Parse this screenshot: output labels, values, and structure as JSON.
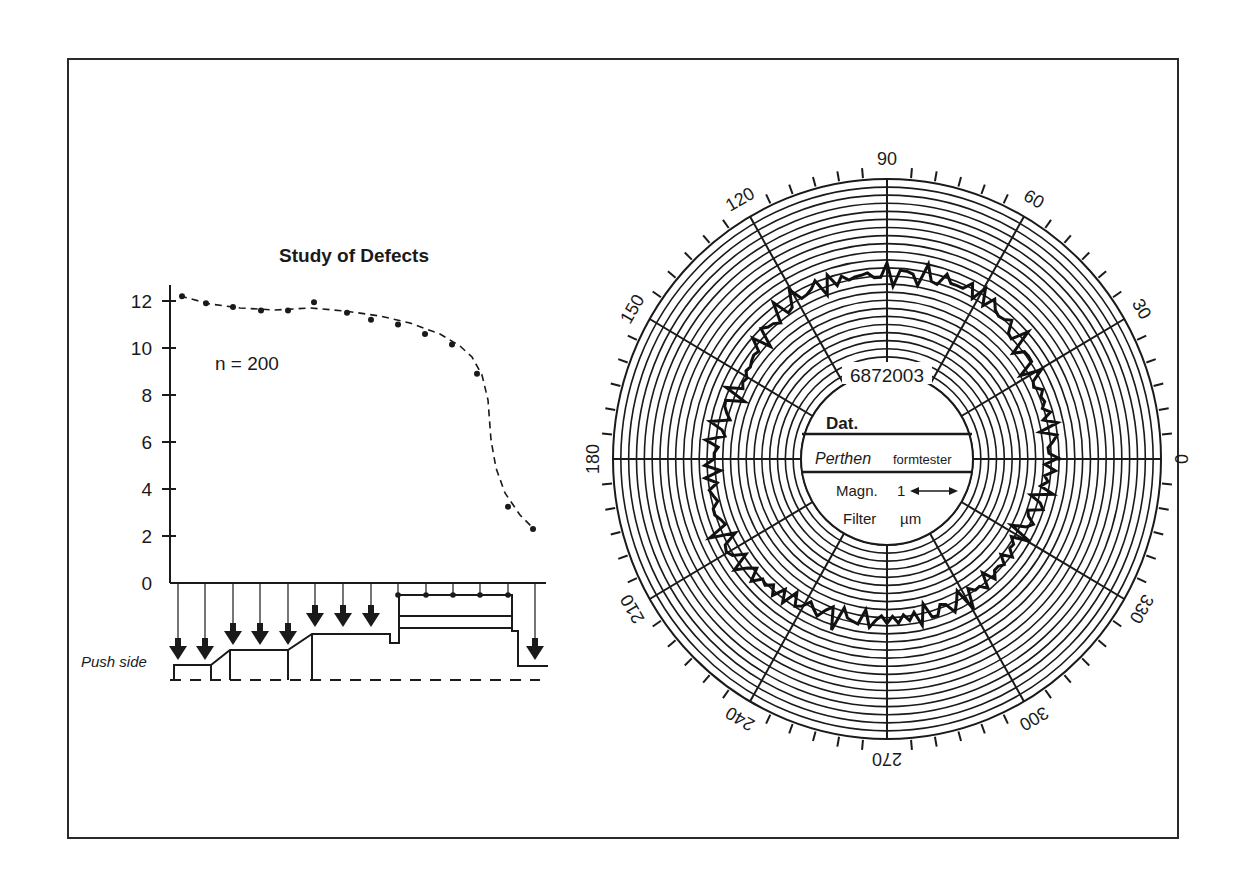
{
  "chart_data": [
    {
      "type": "scatter",
      "title": "Study of Defects",
      "annotation": "n = 200",
      "xlabel": "",
      "ylabel": "",
      "ylim": [
        0,
        12
      ],
      "yticks": [
        0,
        2,
        4,
        6,
        8,
        10,
        12
      ],
      "grid": false,
      "x": [
        1,
        2,
        3,
        4,
        5,
        6,
        7,
        8,
        9,
        10,
        11,
        12,
        13,
        14
      ],
      "values": [
        12.2,
        11.9,
        11.75,
        11.6,
        11.6,
        11.95,
        11.5,
        11.2,
        11.0,
        10.6,
        10.15,
        8.9,
        3.25,
        2.3
      ],
      "trend_line": "dashed fitted curve",
      "lower_diagram_label": "Push side"
    },
    {
      "type": "polar",
      "title": "Perthen formtester roundness chart",
      "angle_labels": [
        0,
        30,
        60,
        90,
        120,
        150,
        180,
        210,
        240,
        270,
        300,
        330
      ],
      "center_fields": {
        "chart_number": "6872003",
        "date_label": "Dat.",
        "brand": "Perthen",
        "device": "formtester",
        "magnification_label": "Magn.",
        "magnification_value": "1",
        "filter_label": "Filter",
        "unit": "µm"
      },
      "profile": {
        "angles_deg": [
          0,
          30,
          60,
          90,
          120,
          150,
          180,
          210,
          240,
          270,
          300,
          330
        ],
        "radius_px": [
          165,
          168,
          190,
          185,
          186,
          163,
          175,
          182,
          168,
          161,
          160,
          152
        ]
      }
    }
  ],
  "left_chart": {
    "title": "Study of Defects",
    "n_label": "n = 200",
    "push_side_label": "Push side",
    "y_tick_labels": [
      "0",
      "2",
      "4",
      "6",
      "8",
      "10",
      "12"
    ]
  },
  "polar_chart": {
    "angle_labels": [
      "0",
      "30",
      "60",
      "90",
      "120",
      "150",
      "180",
      "210",
      "240",
      "270",
      "300",
      "330"
    ],
    "chart_number": "6872003",
    "date_label": "Dat.",
    "brand": "Perthen",
    "device": "formtester",
    "magn_label": "Magn.",
    "magn_value": "1",
    "filter_label": "Filter",
    "unit": "µm"
  }
}
